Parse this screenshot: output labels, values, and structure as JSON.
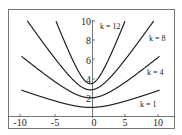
{
  "chart_data": {
    "type": "line",
    "title": "",
    "xlabel": "",
    "ylabel": "",
    "xlim": [
      -10,
      10
    ],
    "ylim": [
      0,
      10
    ],
    "grid": false,
    "legend": "inline labels",
    "x_ticks": [
      "-10",
      "-5",
      "0",
      "5",
      "10"
    ],
    "y_ticks": [
      "2",
      "4",
      "6",
      "8",
      "10"
    ],
    "series": [
      {
        "name": "k = 1",
        "k": 1,
        "x": [
          -10,
          -5,
          0,
          5,
          10
        ],
        "y": [
          2.8,
          1.6,
          1.0,
          1.6,
          2.8
        ]
      },
      {
        "name": "k = 4",
        "k": 4,
        "x": [
          -10,
          -5,
          0,
          5,
          10
        ],
        "y": [
          6.1,
          3.6,
          2.0,
          3.6,
          6.1
        ]
      },
      {
        "name": "k = 8",
        "k": 8,
        "x": [
          -9.2,
          -5,
          0,
          5,
          9.6
        ],
        "y": [
          10.0,
          5.9,
          2.83,
          5.9,
          10.0
        ]
      },
      {
        "name": "k = 12",
        "k": 12,
        "x": [
          -5,
          -2.5,
          0,
          2.5,
          5.3
        ],
        "y": [
          10.0,
          5.8,
          3.46,
          5.8,
          10.0
        ]
      }
    ],
    "annotations": [
      {
        "text": "k = 12",
        "x": 2.5,
        "y": 9.3
      },
      {
        "text": "k = 8",
        "x": 9.3,
        "y": 8.1
      },
      {
        "text": "k = 4",
        "x": 9.0,
        "y": 4.5
      },
      {
        "text": "k = 1",
        "x": 7.8,
        "y": 1.3
      }
    ],
    "curve_params": {
      "1": 0.068,
      "4": 0.36,
      "8": 1.1,
      "12": 3.5
    }
  },
  "labels": {
    "x_ticks": [
      "-10",
      "-5",
      "0",
      "5",
      "10"
    ],
    "y_ticks": [
      "2",
      "4",
      "6",
      "8",
      "10"
    ],
    "k12": "k = 12",
    "k8": "k = 8",
    "k4": "k = 4",
    "k1": "k = 1"
  },
  "colors": {
    "curve": "#222222",
    "frame": "#666666",
    "axis": "#444444"
  }
}
